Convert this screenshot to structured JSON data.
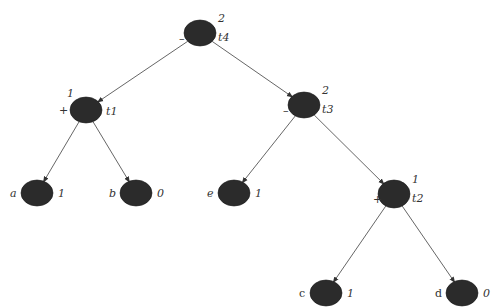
{
  "diagram": {
    "type": "binary-tree",
    "colors": {
      "node_fill": "#2b2b2b",
      "edge": "#555555",
      "text": "#333333"
    },
    "nodes": [
      {
        "id": "t4",
        "name": "t4",
        "value": "2",
        "sign": "–",
        "cx": 200,
        "cy": 33,
        "rx": 16,
        "ry": 13,
        "leaf": false
      },
      {
        "id": "t1",
        "name": "t1",
        "value": "1",
        "sign": "+",
        "cx": 86,
        "cy": 110,
        "rx": 16,
        "ry": 13,
        "leaf": false
      },
      {
        "id": "t3",
        "name": "t3",
        "value": "2",
        "sign": "–",
        "cx": 304,
        "cy": 105,
        "rx": 16,
        "ry": 13,
        "leaf": false
      },
      {
        "id": "t2",
        "name": "t2",
        "value": "1",
        "sign": "+",
        "cx": 394,
        "cy": 194,
        "rx": 16,
        "ry": 14,
        "leaf": false
      },
      {
        "id": "a",
        "name": "a",
        "value": "1",
        "cx": 37,
        "cy": 193,
        "rx": 16,
        "ry": 13,
        "leaf": true
      },
      {
        "id": "b",
        "name": "b",
        "value": "0",
        "cx": 136,
        "cy": 193,
        "rx": 16,
        "ry": 13,
        "leaf": true
      },
      {
        "id": "e",
        "name": "e",
        "value": "1",
        "cx": 234,
        "cy": 193,
        "rx": 16,
        "ry": 13,
        "leaf": true
      },
      {
        "id": "c",
        "name": "c",
        "value": "1",
        "cx": 326,
        "cy": 293,
        "rx": 16,
        "ry": 13,
        "leaf": true
      },
      {
        "id": "d",
        "name": "d",
        "value": "0",
        "cx": 462,
        "cy": 293,
        "rx": 16,
        "ry": 13,
        "leaf": true
      }
    ],
    "edges": [
      {
        "from": "t4",
        "to": "t1"
      },
      {
        "from": "t4",
        "to": "t3"
      },
      {
        "from": "t1",
        "to": "a"
      },
      {
        "from": "t1",
        "to": "b"
      },
      {
        "from": "t3",
        "to": "e"
      },
      {
        "from": "t3",
        "to": "t2"
      },
      {
        "from": "t2",
        "to": "c"
      },
      {
        "from": "t2",
        "to": "d"
      }
    ]
  }
}
